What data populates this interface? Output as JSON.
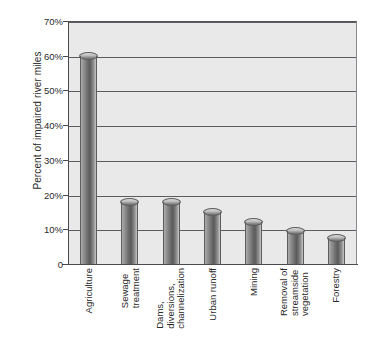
{
  "chart_data": {
    "type": "bar",
    "title": "",
    "xlabel": "",
    "ylabel": "Percent of impaired river miles",
    "categories": [
      "Agriculture",
      "Sewage treatment",
      "Dams, diversions, channelization",
      "Urban runoff",
      "Mining",
      "Removal of streamside vegetation",
      "Forestry"
    ],
    "category_lines": [
      [
        "Agriculture"
      ],
      [
        "Sewage",
        "treatment"
      ],
      [
        "Dams,",
        "diversions,",
        "channelization"
      ],
      [
        "Urban runoff"
      ],
      [
        "Mining"
      ],
      [
        "Removal of",
        "streamside",
        "vegetation"
      ],
      [
        "Forestry"
      ]
    ],
    "values": [
      60,
      18,
      18,
      15,
      12,
      9.5,
      7.5
    ],
    "ylim": [
      0,
      70
    ],
    "yticks": [
      0,
      10,
      20,
      30,
      40,
      50,
      60,
      70
    ],
    "ytick_labels": [
      "0",
      "10%",
      "20%",
      "30%",
      "40%",
      "50%",
      "60%",
      "70%"
    ],
    "grid": true,
    "legend": "none",
    "bar_style": "3d-cylinder",
    "colors": {
      "plot_background": "#e9e9e9",
      "gridline": "#5b5b60",
      "axis": "#4a4a4f",
      "bar_light": "#cfcfcf",
      "bar_dark": "#5a5a5a",
      "text": "#2a2a2a",
      "figure_background": "#ffffff"
    }
  }
}
